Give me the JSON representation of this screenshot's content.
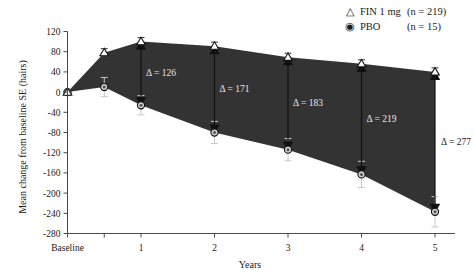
{
  "chart_data": {
    "type": "line",
    "title": "",
    "xlabel": "Years",
    "ylabel": "Mean change from baseline  SE (hairs)",
    "xlim": [
      0,
      5
    ],
    "ylim": [
      -280,
      120
    ],
    "grid": false,
    "x": [
      0,
      0.5,
      1,
      2,
      3,
      4,
      5
    ],
    "xtick_labels": [
      "Baseline",
      "1",
      "2",
      "3",
      "4",
      "5"
    ],
    "xtick_values": [
      0,
      1,
      2,
      3,
      4,
      5
    ],
    "ytick_labels": [
      "120",
      "80",
      "40",
      "0",
      "-40",
      "-80",
      "-120",
      "-160",
      "-200",
      "-240",
      "-280"
    ],
    "ytick_values": [
      120,
      80,
      40,
      0,
      -40,
      -80,
      -120,
      -160,
      -200,
      -240,
      -280
    ],
    "legend_position": "top-right",
    "series": [
      {
        "name": "FIN 1 mg",
        "marker": "triangle-open",
        "values": [
          0,
          78,
          100,
          91,
          69,
          56,
          40
        ],
        "errors": [
          0,
          8,
          8,
          8,
          8,
          8,
          8
        ]
      },
      {
        "name": "PBO",
        "marker": "circle-filled",
        "values": [
          0,
          10,
          -26,
          -80,
          -114,
          -163,
          -237
        ],
        "errors": [
          0,
          19,
          19,
          22,
          22,
          26,
          30
        ]
      }
    ],
    "annotations": [
      {
        "label": "Δ = 126",
        "x": 1,
        "top": 100,
        "bottom": -26
      },
      {
        "label": "Δ = 171",
        "x": 2,
        "top": 91,
        "bottom": -80
      },
      {
        "label": "Δ = 183",
        "x": 3,
        "top": 69,
        "bottom": -114
      },
      {
        "label": "Δ = 219",
        "x": 4,
        "top": 56,
        "bottom": -163
      },
      {
        "label": "Δ = 277",
        "x": 5,
        "top": 40,
        "bottom": -237
      }
    ],
    "band_color": "#333333"
  },
  "legend": {
    "fin": {
      "symbol": "△",
      "label": "FIN 1 mg",
      "n": "(n = 219)"
    },
    "pbo": {
      "symbol": "◉",
      "label": "PBO",
      "n": "(n = 15)"
    }
  }
}
